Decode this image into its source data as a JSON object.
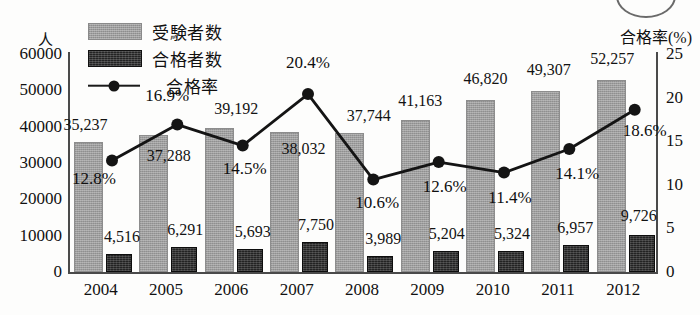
{
  "axis_titles": {
    "left": "人",
    "right": "合格率(%)"
  },
  "legend": [
    {
      "key": "applicants",
      "label": "受験者数",
      "icon": "gray-bar-swatch",
      "color": "#9d9d9d"
    },
    {
      "key": "passers",
      "label": "合格者数",
      "icon": "dark-bar-swatch",
      "color": "#232323"
    },
    {
      "key": "pass_rate",
      "label": "合格率",
      "icon": "line-marker-swatch",
      "color": "#141414"
    }
  ],
  "chart_data": {
    "type": "bar",
    "title": "",
    "xlabel": "",
    "ylabel": "人",
    "y2label": "合格率(%)",
    "categories": [
      "2004",
      "2005",
      "2006",
      "2007",
      "2008",
      "2009",
      "2010",
      "2011",
      "2012"
    ],
    "ylim": [
      0,
      60000
    ],
    "y2lim": [
      0,
      25
    ],
    "yticks": [
      "0",
      "10000",
      "20000",
      "30000",
      "40000",
      "50000",
      "60000"
    ],
    "ytick_values": [
      0,
      10000,
      20000,
      30000,
      40000,
      50000,
      60000
    ],
    "y2ticks": [
      "0",
      "5",
      "10",
      "15",
      "20",
      "25"
    ],
    "y2tick_values": [
      0,
      5,
      10,
      15,
      20,
      25
    ],
    "grid": false,
    "legend_position": "top-left",
    "series": [
      {
        "name": "受験者数",
        "type": "bar",
        "axis": "left",
        "color": "#9d9d9d",
        "values": [
          35237,
          37288,
          39192,
          38032,
          37744,
          41163,
          46820,
          49307,
          52257
        ],
        "labels": [
          "35,237",
          "37,288",
          "39,192",
          "38,032",
          "37,744",
          "41,163",
          "46,820",
          "49,307",
          "52,257"
        ]
      },
      {
        "name": "合格者数",
        "type": "bar",
        "axis": "left",
        "color": "#232323",
        "values": [
          4516,
          6291,
          5693,
          7750,
          3989,
          5204,
          5324,
          6957,
          9726
        ],
        "labels": [
          "4,516",
          "6,291",
          "5,693",
          "7,750",
          "3,989",
          "5,204",
          "5,324",
          "6,957",
          "9,726"
        ]
      },
      {
        "name": "合格率",
        "type": "line",
        "axis": "right",
        "color": "#141414",
        "values": [
          12.8,
          16.9,
          14.5,
          20.4,
          10.6,
          12.6,
          11.4,
          14.1,
          18.6
        ],
        "labels": [
          "12.8%",
          "16.9%",
          "14.5%",
          "20.4%",
          "10.6%",
          "12.6%",
          "11.4%",
          "14.1%",
          "18.6%"
        ]
      }
    ]
  }
}
